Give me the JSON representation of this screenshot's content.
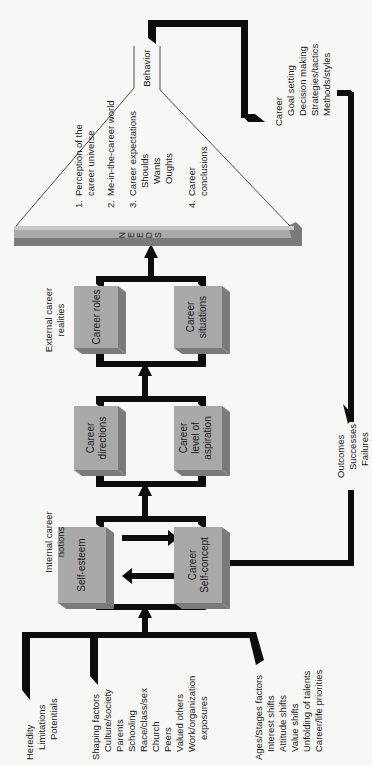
{
  "diagram": {
    "orientation": "rotated-90-ccw",
    "colors": {
      "background": "#f7f7f5",
      "box_face": "#a9a9a9",
      "box_shadow": "#7b7b7b",
      "connector": "#0c0c0c",
      "text": "#1a1a1a"
    },
    "inputs": {
      "heredity": {
        "title": "Heredity",
        "items": [
          "Limitations",
          "Potentials"
        ]
      },
      "shaping": {
        "title": "Shaping factors",
        "items": [
          "Culture/society",
          "Parents",
          "Schooling",
          "Race/class/sex",
          "Church",
          "Peers",
          "Valued others",
          "Work/organization",
          "exposures"
        ]
      },
      "ages": {
        "title": "Ages/Stages factors",
        "items": [
          "Interest shifts",
          "Attitude shifts",
          "Value shifts",
          "Unfolding of talents",
          "Career/life priorities"
        ]
      }
    },
    "stages": {
      "internal": {
        "heading_line1": "Internal career",
        "heading_line2": "notions"
      },
      "external": {
        "heading_line1": "External career",
        "heading_line2": "realities"
      }
    },
    "boxes": {
      "self_esteem": {
        "line1": "Self-esteem"
      },
      "self_concept": {
        "line1": "Career",
        "line2": "Self-concept"
      },
      "directions": {
        "line1": "Career",
        "line2": "directions"
      },
      "aspiration": {
        "line1": "Career",
        "line2": "level of",
        "line3": "aspiration"
      },
      "roles": {
        "line1": "Career roles"
      },
      "situations": {
        "line1": "Career",
        "line2": "situations"
      }
    },
    "needs": {
      "letters": [
        "N",
        "E",
        "E",
        "D",
        "S"
      ]
    },
    "cone": {
      "items": [
        {
          "num": "1.",
          "line1": "Perception of the",
          "line2": "career universe"
        },
        {
          "num": "2.",
          "line1": "Me-in-the-career world"
        },
        {
          "num": "3.",
          "line1": "Career expectations",
          "sub": [
            "Shoulds",
            "Wants",
            "Oughts"
          ]
        },
        {
          "num": "4.",
          "line1": "Career",
          "line2": "conclusions"
        }
      ],
      "apex_label": "Behavior"
    },
    "behavior": {
      "title": "Career",
      "items": [
        "Goal setting",
        "Decision making",
        "Strategies/tactics",
        "Methods/styles"
      ]
    },
    "outcomes": {
      "title": "Outcomes",
      "items": [
        "Successes",
        "Failures"
      ]
    }
  }
}
